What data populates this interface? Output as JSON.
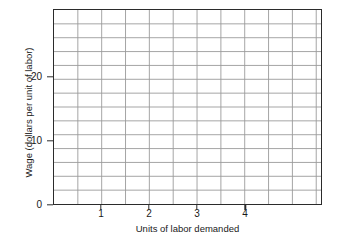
{
  "chart_data": {
    "type": "line",
    "title": "",
    "xlabel": "Units of labor demanded",
    "ylabel": "Wage (dollars per unit of labor)",
    "xlim": [
      0,
      5.6
    ],
    "ylim": [
      0,
      30.6
    ],
    "x_ticks": [
      1,
      2,
      3,
      4
    ],
    "x_tick_labels": [
      "1",
      "2",
      "3",
      "4"
    ],
    "y_ticks": [
      0,
      10,
      20
    ],
    "y_tick_labels": [
      "0",
      "10",
      "20"
    ],
    "grid": true,
    "grid_x_step": 0.5,
    "grid_y_step": 2.1857,
    "legend": "none",
    "series": [],
    "annotations": [],
    "note": "Empty graph template / blank grid with no plotted data series"
  },
  "axes": {
    "y_title": "Wage (dollars per unit of labor)",
    "x_title": "Units of labor demanded"
  },
  "colors": {
    "frame": "#2b2b2b",
    "grid": "#9a9a9a",
    "background": "#ffffff",
    "text": "#1a1a1a"
  }
}
